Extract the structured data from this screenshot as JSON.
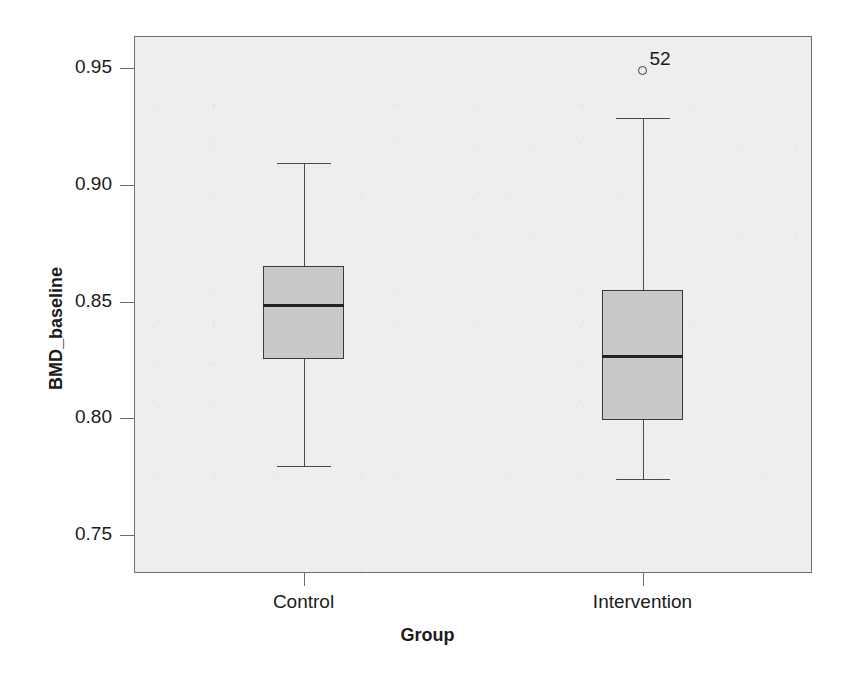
{
  "chart_data": {
    "type": "box",
    "title": "",
    "xlabel": "Group",
    "ylabel": "BMD_baseline",
    "categories": [
      "Control",
      "Intervention"
    ],
    "ylim": [
      0.7342,
      0.9642
    ],
    "yticks": [
      0.95,
      0.9,
      0.85,
      0.8,
      0.75
    ],
    "ytick_labels": [
      "0.95",
      "0.90",
      "0.85",
      "0.80",
      "0.75"
    ],
    "grid": false,
    "legend": "none",
    "boxes": [
      {
        "name": "Control",
        "whisker_low": 0.78,
        "q1": 0.8258,
        "median": 0.8495,
        "q3": 0.8655,
        "whisker_high": 0.91,
        "outliers": []
      },
      {
        "name": "Intervention",
        "whisker_low": 0.7746,
        "q1": 0.7996,
        "median": 0.8275,
        "q3": 0.8554,
        "whisker_high": 0.9292,
        "outliers": [
          {
            "value": 0.9495,
            "label": "52"
          }
        ]
      }
    ],
    "colors": {
      "box_fill": "#c9c9c9",
      "box_edge": "#3a3a3a",
      "median": "#222222",
      "whisker": "#4a4a4a",
      "panel_background": "#eeeeee",
      "panel_border": "#6d6d6d",
      "text": "#1b1b1b"
    }
  },
  "background_bleed": {
    "lines": [
      "non-profit Group, a private institution for research and",
      "the Committee",
      "Chairman",
      "986 pp.129",
      "Systematic Care",
      "every other trial has been increasing",
      "The Congress",
      "the various",
      "and the Congress",
      "annual report 2007",
      "manuals of British Medical Studies, 1998 and the Health Hazards of",
      "1983. The Surgeon General's Report",
      "New Jersey: After publication of new findings",
      "Public Health in a Time of risk of efficacy, and assessment and",
      "the quality",
      "attention"
    ]
  }
}
